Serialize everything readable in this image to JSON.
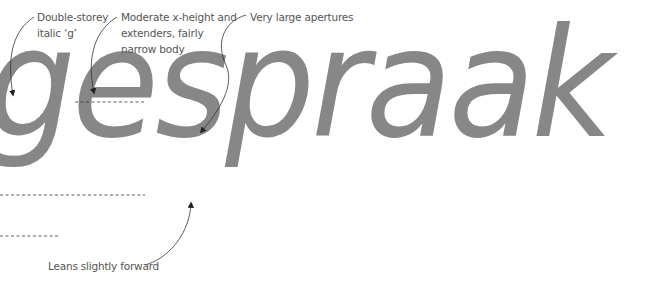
{
  "specimen": {
    "word": "gesprak_placeholder",
    "text": "gespraak",
    "text_color": "#878787"
  },
  "annotations": [
    {
      "id": "g",
      "lines": [
        "Double-storey",
        "italic ‘g’"
      ]
    },
    {
      "id": "xheight",
      "lines": [
        "Moderate x-height and",
        "extenders, fairly",
        "narrow body"
      ]
    },
    {
      "id": "apertures",
      "lines": [
        "Very large apertures"
      ]
    },
    {
      "id": "lean",
      "lines": [
        "Leans slightly forward"
      ]
    }
  ]
}
